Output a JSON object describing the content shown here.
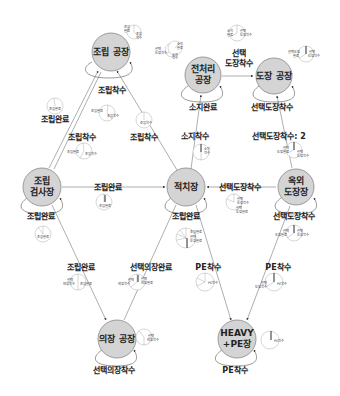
{
  "nodes": {
    "assembly_plant": {
      "line1": "조립 공장",
      "line2": ""
    },
    "preprocessing_plant": {
      "line1": "전처리",
      "line2": "공장"
    },
    "painting_plant": {
      "line1": "도장 공장",
      "line2": ""
    },
    "assembly_inspection": {
      "line1": "조립",
      "line2": "검사장"
    },
    "stockyard": {
      "line1": "적치장",
      "line2": ""
    },
    "outdoor_painting": {
      "line1": "옥외",
      "line2": "도장장"
    },
    "outfitting_plant": {
      "line1": "의장 공장",
      "line2": ""
    },
    "heavy_pe": {
      "line1": "HEAVY",
      "line2": "+PE장"
    }
  },
  "edges": {
    "assembly_self": "조립착수",
    "assembly_to_inspection_a": "조립완료",
    "assembly_to_inspection_b": "조립착수",
    "assembly_to_stockyard": "조립착수",
    "preprocessing_self": "소지완료",
    "preprocessing_to_painting_l1": "선택",
    "preprocessing_to_painting_l2": "도장착수",
    "stockyard_to_preprocessing": "소지착수",
    "painting_self": "선택도장착수",
    "outdoor_to_painting": "선택도장착수: 2",
    "inspection_to_stockyard": "조립완료",
    "inspection_self": "조립완료",
    "outdoor_to_stockyard": "선택도장착수",
    "stockyard_self": "조립완료",
    "outdoor_self": "선택도장착수",
    "inspection_to_outfitting": "조립완료",
    "stockyard_to_outfitting": "선택의장완료",
    "stockyard_to_heavy": "PE착수",
    "outdoor_to_heavy": "PE착수",
    "outfitting_self": "선택의장착수",
    "heavy_self": "PE착수"
  },
  "pies": {
    "p1": [
      "조립",
      "완료",
      "조립",
      "착수"
    ],
    "p2": [
      "선택",
      "도장착수"
    ],
    "p3": [
      "소지",
      "완료",
      "소지",
      "착수"
    ],
    "p4": [
      "소지",
      "완료",
      "선택",
      "도장착수"
    ],
    "p5": [
      "선택도장",
      "완료",
      "선택",
      "도장착수"
    ],
    "p6": [
      "조립완료"
    ],
    "p7": [
      "조립완료",
      "조립착수"
    ],
    "p8": [
      "조립착수"
    ],
    "p9": [
      "조립완료",
      "조립착수"
    ],
    "p10": [
      "소지",
      "착수"
    ],
    "p11": [
      "선택",
      "도장완료",
      "선택",
      "도장착수"
    ],
    "p12": [
      "조립완료"
    ],
    "p13": [
      "조립완료"
    ],
    "p14": [
      "선택",
      "도장착수",
      "선택",
      "도장완료"
    ],
    "p15": [
      "조립완료",
      "선택",
      "도장완료"
    ],
    "p16": [
      "선택",
      "도장완료",
      "선택",
      "도장착수"
    ],
    "p17": [
      "선택",
      "의장착수",
      "조립완료"
    ],
    "p18": [
      "선택",
      "의장착수",
      "선택",
      "의장완료"
    ],
    "p19": [
      "선택",
      "의장착수"
    ],
    "p20": [
      "PE착수"
    ],
    "p21": [
      "선택",
      "도장착수",
      "PE착수"
    ],
    "p22": [
      "PE착수"
    ]
  }
}
